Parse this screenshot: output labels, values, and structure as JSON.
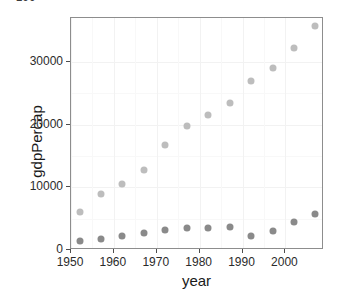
{
  "figure": {
    "top_fragment_text": "100",
    "background_color": "#ffffff",
    "panel_border_color": "#8d8d8d"
  },
  "chart_data": {
    "type": "scatter",
    "title": "",
    "xlabel": "year",
    "ylabel": "gdpPercap",
    "xlim": [
      1950,
      2009
    ],
    "ylim": [
      0,
      37000
    ],
    "grid": true,
    "legend": "none",
    "x_ticks": [
      1950,
      1960,
      1970,
      1980,
      1990,
      2000
    ],
    "x_tick_labels": [
      "1950",
      "1960",
      "1970",
      "1980",
      "1990",
      "2000"
    ],
    "y_ticks": [
      0,
      10000,
      20000,
      30000
    ],
    "y_tick_labels": [
      "0",
      "10000",
      "20000",
      "30000"
    ],
    "x": [
      1952,
      1957,
      1962,
      1967,
      1972,
      1977,
      1982,
      1987,
      1992,
      1997,
      2002,
      2007
    ],
    "series": [
      {
        "name": "upper-series",
        "color": "#bdbdbd",
        "values": [
          6000,
          8900,
          10600,
          12700,
          16700,
          19800,
          21500,
          23500,
          27000,
          29000,
          32200,
          35800
        ]
      },
      {
        "name": "lower-series",
        "color": "#8a8a8a",
        "values": [
          1500,
          1800,
          2200,
          2700,
          3200,
          3500,
          3550,
          3600,
          2300,
          3050,
          4400,
          5700
        ]
      }
    ]
  }
}
